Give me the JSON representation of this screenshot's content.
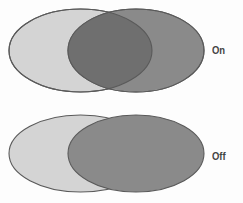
{
  "figure": {
    "background_color": "#fdfdfd",
    "outline_color": "#5a5a5a",
    "rows": [
      {
        "label": "On",
        "transparency": "on",
        "left_ellipse": {
          "fill": "#d4d4d4",
          "cx": 80.5,
          "cy": 50.5,
          "rx": 71.5,
          "ry": 41.5
        },
        "right_ellipse": {
          "fill": "#8a8a8a",
          "cx": 136.0,
          "cy": 50.5,
          "rx": 68.0,
          "ry": 41.5
        },
        "overlap_fill": "#6f6f6f",
        "overlap_visible": true
      },
      {
        "label": "Off",
        "transparency": "off",
        "left_ellipse": {
          "fill": "#d4d4d4",
          "cx": 80.5,
          "cy": 153.5,
          "rx": 71.5,
          "ry": 38.5
        },
        "right_ellipse": {
          "fill": "#8a8a8a",
          "cx": 136.0,
          "cy": 153.5,
          "rx": 68.0,
          "ry": 38.5
        },
        "overlap_fill": "#8a8a8a",
        "overlap_visible": false
      }
    ]
  }
}
